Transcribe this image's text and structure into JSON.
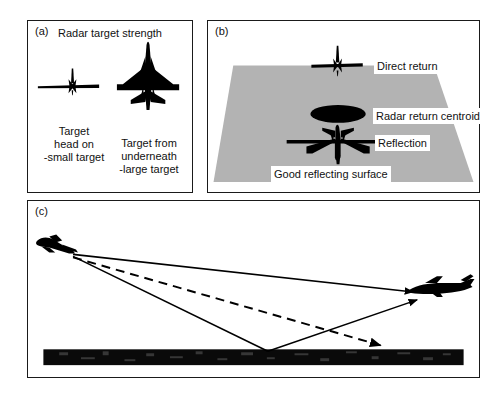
{
  "figure": {
    "panels": [
      {
        "id": "a",
        "label": "(a)",
        "title": "Radar target strength",
        "items": [
          {
            "icon": "aircraft-head-on-icon",
            "caption": "Target\nhead on\n-small target",
            "caption_lines": [
              "Target",
              "head on",
              "-small target"
            ]
          },
          {
            "icon": "aircraft-planform-icon",
            "caption": "Target from\nunderneath\n-large target",
            "caption_lines": [
              "Target from",
              "underneath",
              "-large target"
            ]
          }
        ]
      },
      {
        "id": "b",
        "label": "(b)",
        "surface_color": "#b3b3b3",
        "labels": {
          "direct_return": "Direct return",
          "radar_return_centroid": "Radar return centroid",
          "reflection": "Reflection",
          "good_reflecting_surface": "Good reflecting surface"
        }
      },
      {
        "id": "c",
        "label": "(c)",
        "ground_color": "#000000"
      }
    ],
    "colors": {
      "ink": "#111111",
      "silhouette": "#000000",
      "surface_gray": "#b3b3b3",
      "background": "#ffffff"
    }
  }
}
